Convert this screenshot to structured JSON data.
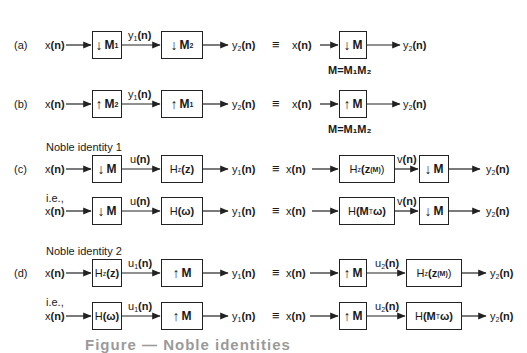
{
  "rows": {
    "a": {
      "tag": "(a)",
      "lhs": {
        "input": "x(n)",
        "box1": {
          "arrow": "down",
          "sym": "M",
          "sub": "1"
        },
        "mid": "y",
        "mid_sub": "1",
        "mid_arg": "(n)",
        "box2": {
          "arrow": "down",
          "sym": "M",
          "sub": "2"
        },
        "output": "y",
        "output_sub": "2",
        "output_arg": "(n)"
      },
      "equiv": "≡",
      "rhs": {
        "input": "x(n)",
        "box": {
          "arrow": "down",
          "sym": "M"
        },
        "output": "y",
        "output_sub": "2",
        "output_arg": "(n)"
      },
      "note": "M=M₁M₂"
    },
    "b": {
      "tag": "(b)",
      "lhs": {
        "input": "x(n)",
        "box1": {
          "arrow": "up",
          "sym": "M",
          "sub": "2"
        },
        "mid": "y",
        "mid_sub": "1",
        "mid_arg": "(n)",
        "box2": {
          "arrow": "up",
          "sym": "M",
          "sub": "1"
        },
        "output": "y",
        "output_sub": "2",
        "output_arg": "(n)"
      },
      "equiv": "≡",
      "rhs": {
        "input": "x(n)",
        "box": {
          "arrow": "up",
          "sym": "M"
        },
        "output": "y",
        "output_sub": "2",
        "output_arg": "(n)"
      },
      "note": "M=M₁M₂"
    },
    "c": {
      "tag": "(c)",
      "heading": "Noble identity 1",
      "ie": "i.e.,",
      "line1": {
        "input": "x(n)",
        "box1": "↓M",
        "mid": "u(n)",
        "box2": "Hz(z)",
        "output": "y1(n)",
        "equiv": "≡",
        "r_input": "x(n)",
        "r_box1": "Hz(z^(M))",
        "r_mid": "v(n)",
        "r_box2": "↓M",
        "r_output": "y2(n)"
      },
      "line2": {
        "input": "x(n)",
        "box1": "↓M",
        "mid": "u(n)",
        "box2": "H(ω)",
        "output": "y1(n)",
        "equiv": "≡",
        "r_input": "x(n)",
        "r_box1": "H(Mᵀω)",
        "r_mid": "v(n)",
        "r_box2": "↓M",
        "r_output": "y2(n)"
      }
    },
    "d": {
      "tag": "(d)",
      "heading": "Noble identity 2",
      "ie": "i.e.,",
      "line1": {
        "input": "x(n)",
        "box1": "Hz(z)",
        "mid": "u1(n)",
        "box2": "↑M",
        "output": "y1(n)",
        "equiv": "≡",
        "r_input": "x(n)",
        "r_box1": "↑M",
        "r_mid": "u2(n)",
        "r_box2": "Hz(z^(M))",
        "r_output": "y2(n)"
      },
      "line2": {
        "input": "x(n)",
        "box1": "H(ω)",
        "mid": "u1(n)",
        "box2": "↑M",
        "output": "y1(n)",
        "equiv": "≡",
        "r_input": "x(n)",
        "r_box1": "↑M",
        "r_mid": "u2(n)",
        "r_box2": "H(Mᵀω)",
        "r_output": "y2(n)"
      }
    }
  },
  "text": {
    "x": "x",
    "y": "y",
    "u": "u",
    "v": "v",
    "n": "(n)",
    "M": "M",
    "H": "H",
    "Hz": "H",
    "z_sub": "z",
    "z": "(z)",
    "zM_open": "(z",
    "zM_sup": "(M)",
    "zM_close": ")",
    "omega": "(ω)",
    "MT_open": "(M",
    "T": "T",
    "MT_close": "ω)",
    "down": "↓",
    "up": "↑",
    "s1": "1",
    "s2": "2"
  },
  "caption": "Figure — Noble identities"
}
